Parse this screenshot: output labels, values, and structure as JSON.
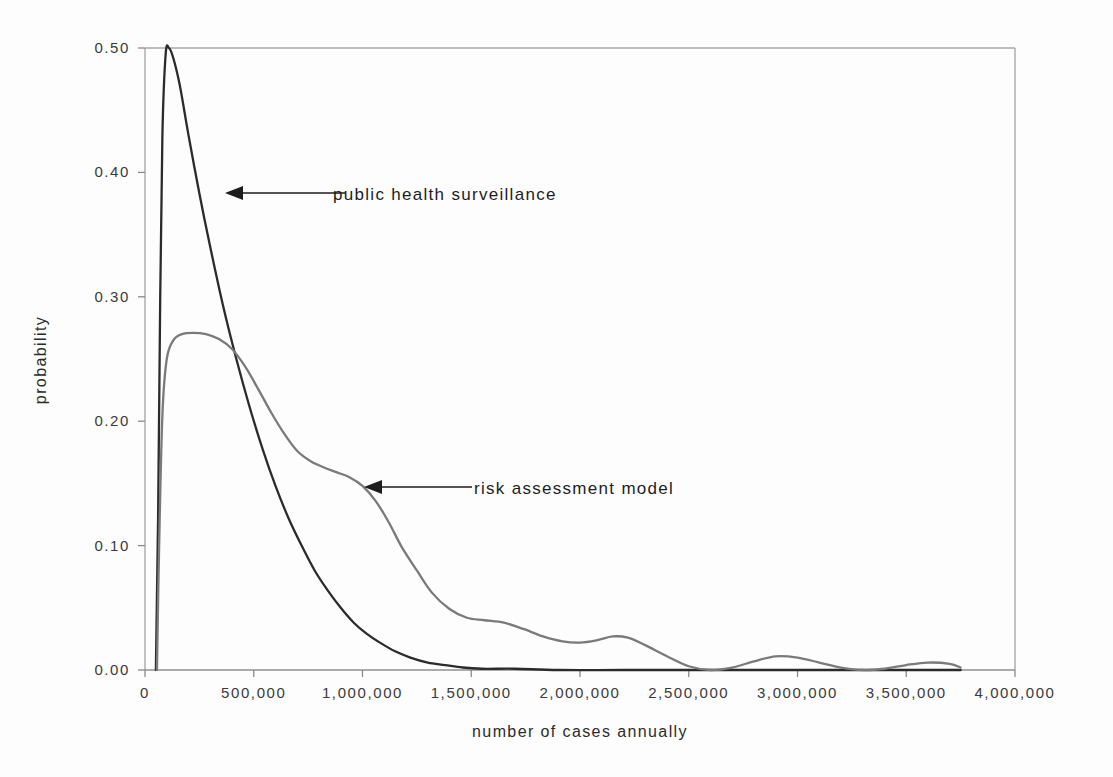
{
  "chart_data": {
    "type": "line",
    "title": "",
    "xlabel": "number of cases annually",
    "ylabel": "probability",
    "xlim": [
      0,
      4000000
    ],
    "ylim": [
      0.0,
      0.5
    ],
    "grid": false,
    "legend_position": "inline-annotations",
    "x_ticks": [
      0,
      500000,
      1000000,
      1500000,
      2000000,
      2500000,
      3000000,
      3500000,
      4000000
    ],
    "x_tick_labels": [
      "0",
      "500,000",
      "1,000,000",
      "1,500,000",
      "2,000,000",
      "2,500,000",
      "3,000,000",
      "3,500,000",
      "4,000,000"
    ],
    "y_ticks": [
      0.0,
      0.1,
      0.2,
      0.3,
      0.4,
      0.5
    ],
    "y_tick_labels": [
      "0.00",
      "0.10",
      "0.20",
      "0.30",
      "0.40",
      "0.50"
    ],
    "series": [
      {
        "name": "public health surveillance",
        "color": "#2b2b2b",
        "x": [
          50000,
          60000,
          70000,
          80000,
          95000,
          110000,
          130000,
          160000,
          200000,
          250000,
          300000,
          360000,
          420000,
          480000,
          540000,
          600000,
          660000,
          720000,
          780000,
          840000,
          900000,
          960000,
          1020000,
          1080000,
          1150000,
          1220000,
          1300000,
          1380000,
          1460000,
          1550000,
          1700000,
          1900000,
          2200000,
          2600000,
          3000000,
          3400000,
          3750000
        ],
        "y": [
          0.0,
          0.12,
          0.3,
          0.43,
          0.495,
          0.5,
          0.492,
          0.47,
          0.43,
          0.383,
          0.34,
          0.292,
          0.25,
          0.212,
          0.178,
          0.148,
          0.122,
          0.1,
          0.08,
          0.064,
          0.05,
          0.038,
          0.029,
          0.022,
          0.015,
          0.01,
          0.006,
          0.004,
          0.002,
          0.001,
          0.001,
          0.0,
          0.0,
          0.0,
          0.0,
          0.0,
          0.0
        ]
      },
      {
        "name": "risk assessment model",
        "color": "#7a7a7a",
        "x": [
          55000,
          65000,
          80000,
          100000,
          130000,
          170000,
          220000,
          280000,
          340000,
          400000,
          460000,
          520000,
          580000,
          640000,
          700000,
          760000,
          820000,
          880000,
          940000,
          1000000,
          1060000,
          1120000,
          1180000,
          1250000,
          1320000,
          1400000,
          1480000,
          1560000,
          1650000,
          1740000,
          1830000,
          1920000,
          2000000,
          2080000,
          2150000,
          2220000,
          2300000,
          2400000,
          2500000,
          2600000,
          2700000,
          2800000,
          2900000,
          3000000,
          3100000,
          3200000,
          3300000,
          3400000,
          3500000,
          3600000,
          3700000,
          3750000
        ],
        "y": [
          0.0,
          0.1,
          0.205,
          0.25,
          0.265,
          0.27,
          0.271,
          0.27,
          0.266,
          0.258,
          0.244,
          0.226,
          0.207,
          0.19,
          0.176,
          0.168,
          0.163,
          0.159,
          0.155,
          0.148,
          0.136,
          0.119,
          0.099,
          0.08,
          0.062,
          0.049,
          0.042,
          0.04,
          0.038,
          0.033,
          0.027,
          0.023,
          0.022,
          0.024,
          0.027,
          0.026,
          0.02,
          0.011,
          0.003,
          0.0,
          0.002,
          0.007,
          0.011,
          0.01,
          0.006,
          0.002,
          0.0,
          0.001,
          0.004,
          0.006,
          0.005,
          0.002
        ]
      }
    ],
    "annotations": [
      {
        "text": "public health surveillance",
        "arrow": "left",
        "points_to_series": "public health surveillance"
      },
      {
        "text": "risk assessment model",
        "arrow": "left",
        "points_to_series": "risk assessment model"
      }
    ]
  },
  "axes": {
    "axis_color": "#9a9a9a",
    "tick_color": "#8a8a8a"
  }
}
